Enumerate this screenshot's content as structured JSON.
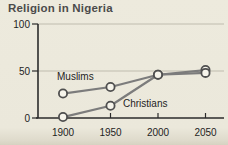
{
  "figure": {
    "title": "Religion in Nigeria"
  },
  "chart_data": {
    "type": "line",
    "title": "Religion in Nigeria",
    "categories": [
      1900,
      1950,
      2000,
      2050
    ],
    "series": [
      {
        "name": "Muslims",
        "values": [
          26,
          33,
          46,
          51
        ]
      },
      {
        "name": "Christians",
        "values": [
          1,
          13,
          46,
          48
        ]
      }
    ],
    "xlabel": "",
    "ylabel": "",
    "ylim": [
      0,
      100
    ],
    "yticks": [
      0,
      50,
      100
    ],
    "xticks": [
      "1900",
      "1950",
      "2000",
      "2050"
    ],
    "grid": true,
    "legend_position": "inline-annotations",
    "annotations": [
      {
        "text": "Muslims",
        "attached_to": "series-0"
      },
      {
        "text": "Christians",
        "attached_to": "series-1"
      }
    ],
    "colors": {
      "background": "#ebe8db",
      "line": "#7c7c7c",
      "marker_fill": "#f6f4eb",
      "marker_stroke": "#4f4f4f",
      "axis": "#2b2b2b",
      "grid": "#bfbcae",
      "tick_text": "#1e1e1e",
      "title_text": "#4b4b4b"
    }
  }
}
